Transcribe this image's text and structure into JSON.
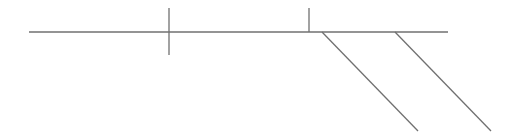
{
  "diagram": {
    "background": "#ffffff",
    "stroke_color": "#707070",
    "stroke_width": 1.3,
    "lines": [
      {
        "id": "main-horizontal-line",
        "x1": 29,
        "y1": 32,
        "x2": 448,
        "y2": 32
      },
      {
        "id": "vertical-tick-1",
        "x1": 169,
        "y1": 8,
        "x2": 169,
        "y2": 55
      },
      {
        "id": "vertical-tick-2",
        "x1": 309,
        "y1": 8,
        "x2": 309,
        "y2": 32
      },
      {
        "id": "diagonal-branch-1",
        "x1": 322,
        "y1": 32,
        "x2": 418,
        "y2": 131
      },
      {
        "id": "diagonal-branch-2",
        "x1": 395,
        "y1": 32,
        "x2": 491,
        "y2": 131
      }
    ]
  }
}
